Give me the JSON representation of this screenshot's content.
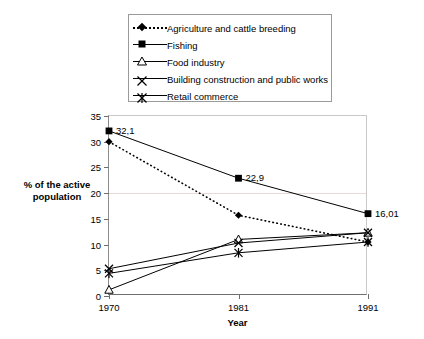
{
  "chart_data": {
    "type": "line",
    "title": "",
    "xlabel": "Year",
    "ylabel": "% of the active population",
    "categories": [
      "1970",
      "1981",
      "1991"
    ],
    "x": [
      1970,
      1981,
      1991
    ],
    "ylim": [
      0,
      35
    ],
    "yticks": [
      0,
      5,
      10,
      15,
      20,
      25,
      30,
      35
    ],
    "grid": true,
    "legend_position": "top",
    "series": [
      {
        "name": "Agriculture and cattle breeding",
        "marker": "diamond",
        "line": "dotted",
        "values": [
          30,
          15.7,
          10.5
        ]
      },
      {
        "name": "Fishing",
        "marker": "square",
        "line": "solid",
        "values": [
          32.1,
          22.9,
          16.01
        ]
      },
      {
        "name": "Food industry",
        "marker": "triangle",
        "line": "solid",
        "values": [
          1.2,
          11,
          12.3
        ]
      },
      {
        "name": "Building construction and public works",
        "marker": "x",
        "line": "solid",
        "values": [
          5.3,
          10.3,
          12.3
        ]
      },
      {
        "name": "Retail commerce",
        "marker": "asterisk",
        "line": "solid",
        "values": [
          4.4,
          8.4,
          10.5
        ]
      }
    ],
    "annotations": [
      {
        "text": "32,1",
        "series": "Fishing",
        "x": "1970",
        "value": 32.1
      },
      {
        "text": "22,9",
        "series": "Fishing",
        "x": "1981",
        "value": 22.9
      },
      {
        "text": "16,01",
        "series": "Fishing",
        "x": "1991",
        "value": 16.01
      }
    ]
  },
  "legend": {
    "items": [
      {
        "label": "Agriculture and cattle breeding"
      },
      {
        "label": "Fishing"
      },
      {
        "label": "Food industry"
      },
      {
        "label": "Building construction and public works"
      },
      {
        "label": "Retail commerce"
      }
    ]
  },
  "axes": {
    "y_title_line1": "% of the active",
    "y_title_line2": "population",
    "x_title": "Year",
    "ytick_labels": [
      "0",
      "5",
      "10",
      "15",
      "20",
      "25",
      "30",
      "35"
    ],
    "xtick_labels": [
      "1970",
      "1981",
      "1991"
    ]
  }
}
